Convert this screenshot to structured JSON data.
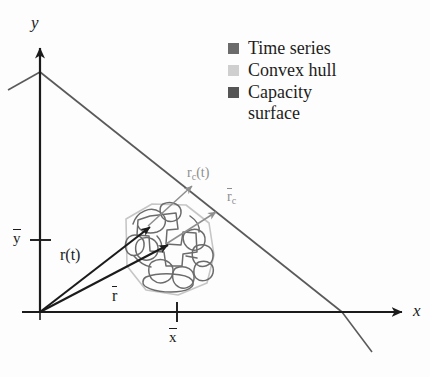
{
  "figure": {
    "name": "capacity-surface-diagram",
    "background_color": "#fdfdfd"
  },
  "axes": {
    "x_label": "x",
    "y_label": "y",
    "x_tick_label": "x",
    "x_tick_overbar": true,
    "y_tick_label": "y",
    "y_tick_overbar": true,
    "axis_color": "#1b1b1b",
    "origin_px": [
      40,
      312
    ],
    "x_axis_end_px": [
      408,
      312
    ],
    "y_axis_end_px": [
      40,
      44
    ]
  },
  "capacity_surface": {
    "label": "Capacity surface",
    "color": "#5a5a5a",
    "apex_px": [
      40,
      72
    ],
    "x_intercept_px": [
      342,
      312
    ],
    "left_tail_px": [
      8,
      90
    ],
    "right_tail_px": [
      372,
      352
    ]
  },
  "vectors": {
    "r_t": {
      "label": "r(t)",
      "color": "#1b1b1b",
      "from_px": [
        40,
        312
      ],
      "to_px": [
        148,
        226
      ],
      "label_px": [
        62,
        252
      ]
    },
    "r_bar": {
      "label": "r",
      "overbar": true,
      "color": "#1b1b1b",
      "from_px": [
        40,
        312
      ],
      "to_px": [
        166,
        244
      ],
      "label_px": [
        113,
        295
      ]
    },
    "rc_t": {
      "label": "r",
      "subscript": "c",
      "suffix": "(t)",
      "overbar": false,
      "color": "#8e8e8e",
      "from_px": [
        148,
        226
      ],
      "to_px": [
        190,
        187
      ],
      "label_px": [
        188,
        170
      ]
    },
    "rc_bar": {
      "label": "r",
      "subscript": "c",
      "overbar": true,
      "color": "#8e8e8e",
      "from_px": [
        166,
        244
      ],
      "to_px": [
        214,
        213
      ],
      "label_px": [
        226,
        195
      ]
    }
  },
  "legend": {
    "items": [
      {
        "label": "Time series",
        "label_line2": "",
        "color": "#6b6b6b",
        "swatch": "filled-square"
      },
      {
        "label": "Convex hull",
        "label_line2": "",
        "color": "#cfcfcf",
        "swatch": "filled-square"
      },
      {
        "label": "Capacity",
        "label_line2": "surface",
        "color": "#555555",
        "swatch": "filled-square"
      }
    ]
  },
  "blob": {
    "time_series_color": "#6b6b6b",
    "convex_hull_color": "#c6c6c6",
    "center_px": [
      172,
      248
    ],
    "description": "tangled closed time-series curves enclosed by a light gray convex hull polygon"
  }
}
